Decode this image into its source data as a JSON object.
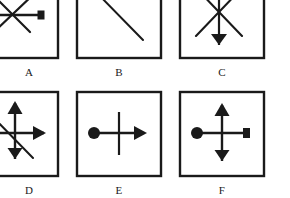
{
  "figure": {
    "background_color": "#ffffff",
    "ink_color": "#1a1a1a",
    "panels": [
      {
        "id": "A",
        "label": "A",
        "box": {
          "x": -28,
          "y": -26,
          "width": 86,
          "height": 84,
          "clipped_edges": "left,top"
        },
        "label_position": {
          "x": 8,
          "y": 66
        },
        "elements": [
          {
            "name": "diagonal-line-down-right",
            "type": "line",
            "x1": -6,
            "y1": -4,
            "x2": 30,
            "y2": 32
          },
          {
            "name": "diagonal-line-up-right",
            "type": "line",
            "x1": -6,
            "y1": 32,
            "x2": 36,
            "y2": -8
          },
          {
            "name": "horizontal-line-with-square",
            "type": "line",
            "x1": -10,
            "y1": 15,
            "x2": 40,
            "y2": 15
          },
          {
            "name": "square-terminator-right",
            "type": "square",
            "cx": 41,
            "cy": 15,
            "size": 8
          }
        ]
      },
      {
        "id": "B",
        "label": "B",
        "box": {
          "x": 77,
          "y": -26,
          "width": 84,
          "height": 84,
          "clipped_edges": "top"
        },
        "label_position": {
          "x": 113,
          "y": 66
        },
        "elements": [
          {
            "name": "diagonal-line-down-right",
            "type": "line",
            "x1": 94,
            "y1": -10,
            "x2": 143,
            "y2": 40
          }
        ]
      },
      {
        "id": "C",
        "label": "C",
        "box": {
          "x": 180,
          "y": -26,
          "width": 84,
          "height": 84,
          "clipped_edges": "top"
        },
        "label_position": {
          "x": 216,
          "y": 66
        },
        "elements": [
          {
            "name": "diagonal-line-down-right",
            "type": "line",
            "x1": 196,
            "y1": -12,
            "x2": 242,
            "y2": 36
          },
          {
            "name": "diagonal-line-up-right",
            "type": "line",
            "x1": 196,
            "y1": 36,
            "x2": 242,
            "y2": -12
          },
          {
            "name": "vertical-line-with-triangle",
            "type": "line",
            "x1": 219,
            "y1": -14,
            "x2": 219,
            "y2": 44
          },
          {
            "name": "triangle-terminator-down",
            "type": "triangle-down",
            "cx": 219,
            "cy": 44,
            "width": 16,
            "height": 11
          }
        ]
      },
      {
        "id": "D",
        "label": "D",
        "box": {
          "x": -28,
          "y": 92,
          "width": 86,
          "height": 84,
          "clipped_edges": "left"
        },
        "label_position": {
          "x": 8,
          "y": 184
        },
        "elements": [
          {
            "name": "diagonal-line-down-right",
            "type": "line",
            "x1": -12,
            "y1": 112,
            "x2": 33,
            "y2": 158
          },
          {
            "name": "vertical-line",
            "type": "line",
            "x1": 15,
            "y1": 104,
            "x2": 15,
            "y2": 156
          },
          {
            "name": "arrowhead-up",
            "type": "arrow-up",
            "cx": 15,
            "cy": 102,
            "width": 15,
            "height": 13
          },
          {
            "name": "triangle-terminator-down",
            "type": "triangle-down",
            "cx": 15,
            "cy": 158,
            "width": 15,
            "height": 11
          },
          {
            "name": "horizontal-line",
            "type": "line",
            "x1": -14,
            "y1": 133,
            "x2": 42,
            "y2": 133
          },
          {
            "name": "arrowhead-right",
            "type": "arrow-right",
            "cx": 44,
            "cy": 133,
            "width": 12,
            "height": 15
          }
        ]
      },
      {
        "id": "E",
        "label": "E",
        "box": {
          "x": 77,
          "y": 92,
          "width": 84,
          "height": 84,
          "clipped_edges": "none"
        },
        "label_position": {
          "x": 113,
          "y": 184
        },
        "elements": [
          {
            "name": "vertical-line",
            "type": "line",
            "x1": 119,
            "y1": 112,
            "x2": 119,
            "y2": 155
          },
          {
            "name": "horizontal-line",
            "type": "line",
            "x1": 94,
            "y1": 133,
            "x2": 142,
            "y2": 133
          },
          {
            "name": "circle-terminator-left",
            "type": "circle",
            "cx": 94,
            "cy": 133,
            "r": 6
          },
          {
            "name": "arrowhead-right",
            "type": "arrow-right",
            "cx": 145,
            "cy": 133,
            "width": 12,
            "height": 15
          }
        ]
      },
      {
        "id": "F",
        "label": "F",
        "box": {
          "x": 180,
          "y": 92,
          "width": 84,
          "height": 84,
          "clipped_edges": "none"
        },
        "label_position": {
          "x": 216,
          "y": 184
        },
        "elements": [
          {
            "name": "vertical-line",
            "type": "line",
            "x1": 222,
            "y1": 106,
            "x2": 222,
            "y2": 158
          },
          {
            "name": "arrowhead-up",
            "type": "arrow-up",
            "cx": 222,
            "cy": 104,
            "width": 15,
            "height": 13
          },
          {
            "name": "triangle-terminator-down",
            "type": "triangle-down",
            "cx": 222,
            "cy": 160,
            "width": 15,
            "height": 11
          },
          {
            "name": "horizontal-line",
            "type": "line",
            "x1": 197,
            "y1": 133,
            "x2": 246,
            "y2": 133
          },
          {
            "name": "circle-terminator-left",
            "type": "circle",
            "cx": 197,
            "cy": 133,
            "r": 6
          },
          {
            "name": "square-terminator-right",
            "type": "square",
            "cx": 247,
            "cy": 133,
            "size": 9
          }
        ]
      }
    ]
  }
}
